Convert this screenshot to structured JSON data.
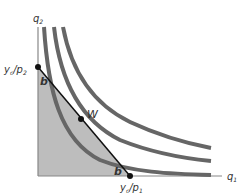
{
  "diagram": {
    "type": "indifference-curves-budget-constraint",
    "axes": {
      "x_label": "q",
      "x_label_sub": "1",
      "y_label": "q",
      "y_label_sub": "2"
    },
    "budget_line": {
      "y_intercept_label": "y",
      "y_intercept_label_sub": "c",
      "y_intercept_label_rest": "/p",
      "y_intercept_label_rest_sub": "2",
      "x_intercept_label": "y",
      "x_intercept_label_sub": "c",
      "x_intercept_label_rest": "/p",
      "x_intercept_label_rest_sub": "1"
    },
    "points": [
      {
        "label": "b",
        "position": "upper-intersection"
      },
      {
        "label": "W",
        "position": "tangency"
      },
      {
        "label": "b",
        "position": "lower-intersection"
      }
    ],
    "indifference_curves": 3,
    "colors": {
      "curve": "#666666",
      "budget_line": "#111111",
      "shaded_region": "#bdbdbd",
      "axis": "#888888"
    }
  }
}
